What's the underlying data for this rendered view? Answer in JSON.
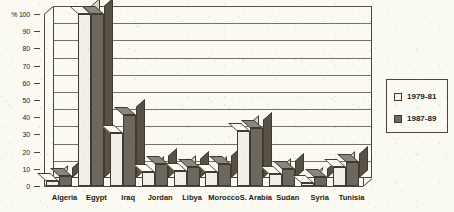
{
  "chart_data": {
    "type": "bar",
    "title": "",
    "subtitle": "",
    "xlabel": "",
    "ylabel": "%",
    "ylim": [
      0,
      100
    ],
    "yticks": [
      0,
      10,
      20,
      30,
      40,
      50,
      60,
      70,
      80,
      90,
      100
    ],
    "ytick_labels": [
      "0",
      "10",
      "20",
      "30",
      "40",
      "50",
      "60",
      "70",
      "80",
      "90",
      "100"
    ],
    "y_axis_unit_label": "%",
    "grid": true,
    "legend_position": "right",
    "style": "3d-clustered-column",
    "categories": [
      "Algeria",
      "Egypt",
      "Iraq",
      "Jordan",
      "Libya",
      "Morocco",
      "S. Arabia",
      "Sudan",
      "Syria",
      "Tunisia"
    ],
    "series": [
      {
        "name": "1979-81",
        "color": "#f2f0e6",
        "values": [
          3,
          100,
          31,
          8,
          9,
          8,
          32,
          7,
          2,
          11
        ]
      },
      {
        "name": "1987-89",
        "color": "#6e675b",
        "values": [
          6,
          100,
          41,
          13,
          11,
          13,
          34,
          10,
          5,
          14
        ]
      }
    ]
  },
  "legend": {
    "entries": [
      {
        "label": "1979-81",
        "swatch": "light"
      },
      {
        "label": "1987-89",
        "swatch": "dark"
      }
    ]
  }
}
